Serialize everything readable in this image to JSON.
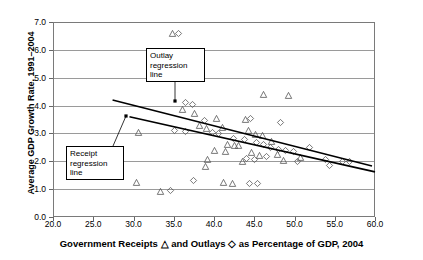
{
  "chart_data": {
    "type": "scatter",
    "title": "",
    "xlabel": "Government Receipts △ and Outlays ◇ as Percentage of GDP, 2004",
    "ylabel": "Average GDP Growth Rate, 1991–2004",
    "xlim": [
      20.0,
      60.0
    ],
    "ylim": [
      0.0,
      7.0
    ],
    "xticks": [
      "20.0",
      "25.0",
      "30.0",
      "35.0",
      "40.0",
      "45.0",
      "50.0",
      "55.0",
      "60.0"
    ],
    "yticks": [
      "0.0",
      "1.0",
      "2.0",
      "3.0",
      "4.0",
      "5.0",
      "6.0",
      "7.0"
    ],
    "grid": "horizontal",
    "legend": "inline-in-axis-title",
    "series": [
      {
        "name": "Government Receipts",
        "marker": "triangle",
        "points": [
          [
            33.9,
            5.63
          ],
          [
            34.9,
            6.6
          ],
          [
            46.2,
            4.38
          ],
          [
            49.3,
            4.37
          ],
          [
            36.1,
            3.85
          ],
          [
            37.6,
            3.7
          ],
          [
            40.3,
            3.55
          ],
          [
            43.9,
            3.5
          ],
          [
            30.6,
            3.05
          ],
          [
            38.2,
            3.3
          ],
          [
            39.1,
            3.18
          ],
          [
            41.1,
            3.2
          ],
          [
            44.3,
            3.1
          ],
          [
            45.1,
            2.95
          ],
          [
            46.0,
            2.92
          ],
          [
            47.2,
            2.72
          ],
          [
            41.7,
            2.62
          ],
          [
            42.5,
            2.58
          ],
          [
            43.1,
            2.55
          ],
          [
            40.0,
            2.4
          ],
          [
            41.4,
            2.35
          ],
          [
            44.7,
            2.3
          ],
          [
            45.6,
            2.22
          ],
          [
            47.9,
            2.25
          ],
          [
            39.2,
            2.08
          ],
          [
            43.6,
            2.0
          ],
          [
            48.6,
            2.02
          ],
          [
            50.8,
            2.12
          ],
          [
            30.4,
            1.25
          ],
          [
            33.3,
            0.92
          ],
          [
            41.2,
            1.25
          ],
          [
            42.3,
            1.2
          ],
          [
            38.9,
            1.8
          ]
        ]
      },
      {
        "name": "Outlays",
        "marker": "diamond",
        "points": [
          [
            32.8,
            5.62
          ],
          [
            35.6,
            6.58
          ],
          [
            36.5,
            4.12
          ],
          [
            37.3,
            4.05
          ],
          [
            44.5,
            3.52
          ],
          [
            48.2,
            3.4
          ],
          [
            35.1,
            3.12
          ],
          [
            36.4,
            3.08
          ],
          [
            38.8,
            3.45
          ],
          [
            39.8,
            3.05
          ],
          [
            40.6,
            3.0
          ],
          [
            42.4,
            2.82
          ],
          [
            43.8,
            2.78
          ],
          [
            45.3,
            2.66
          ],
          [
            46.1,
            2.6
          ],
          [
            47.0,
            2.5
          ],
          [
            48.0,
            2.42
          ],
          [
            48.9,
            2.38
          ],
          [
            49.9,
            2.35
          ],
          [
            51.9,
            2.48
          ],
          [
            53.9,
            2.05
          ],
          [
            54.3,
            1.85
          ],
          [
            56.0,
            2.0
          ],
          [
            56.8,
            2.0
          ],
          [
            44.0,
            2.1
          ],
          [
            45.0,
            2.08
          ],
          [
            46.5,
            2.18
          ],
          [
            37.4,
            1.3
          ],
          [
            34.6,
            0.95
          ],
          [
            44.4,
            1.22
          ],
          [
            45.4,
            1.2
          ],
          [
            50.4,
            2.0
          ]
        ]
      }
    ],
    "trendlines": [
      {
        "name": "Outlay regression line",
        "x_start": 27.4,
        "y_start": 4.2,
        "x_end": 60.0,
        "y_end": 1.8
      },
      {
        "name": "Receipt regression line",
        "x_start": 29.5,
        "y_start": 3.6,
        "x_end": 60.0,
        "y_end": 1.62
      }
    ],
    "annotations": [
      {
        "id": "outlay",
        "line1": "Outlay",
        "line2": "regression",
        "line3": "line"
      },
      {
        "id": "receipt",
        "line1": "Receipt",
        "line2": "regression",
        "line3": "line"
      }
    ]
  }
}
